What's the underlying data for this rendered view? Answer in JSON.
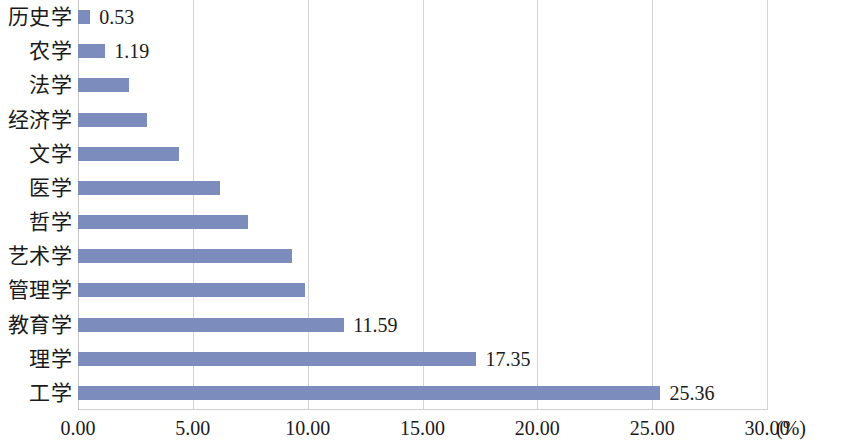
{
  "chart_data": {
    "type": "bar",
    "orientation": "horizontal",
    "title": "",
    "xlabel": "(%)",
    "ylabel": "",
    "xlim": [
      0,
      30
    ],
    "xticks": [
      "0.00",
      "5.00",
      "10.00",
      "15.00",
      "20.00",
      "25.00",
      "30.00"
    ],
    "xtick_values": [
      0,
      5,
      10,
      15,
      20,
      25,
      30
    ],
    "grid": true,
    "legend": false,
    "unit_suffix": "(%)",
    "bar_color": "#7c8cbd",
    "categories": [
      "历史学",
      "农学",
      "法学",
      "经济学",
      "文学",
      "医学",
      "哲学",
      "艺术学",
      "管理学",
      "教育学",
      "理学",
      "工学"
    ],
    "values": [
      0.53,
      1.19,
      2.2,
      3.0,
      4.4,
      6.2,
      7.4,
      9.3,
      9.9,
      11.59,
      17.35,
      25.36
    ],
    "data_labels": [
      "0.53",
      "1.19",
      "",
      "",
      "",
      "",
      "",
      "",
      "",
      "11.59",
      "17.35",
      "25.36"
    ],
    "bars": [
      {
        "category": "历史学",
        "value": 0.53,
        "label": "0.53",
        "label_visible": true
      },
      {
        "category": "农学",
        "value": 1.19,
        "label": "1.19",
        "label_visible": true
      },
      {
        "category": "法学",
        "value": 2.2,
        "label": "",
        "label_visible": false
      },
      {
        "category": "经济学",
        "value": 3.0,
        "label": "",
        "label_visible": false
      },
      {
        "category": "文学",
        "value": 4.4,
        "label": "",
        "label_visible": false
      },
      {
        "category": "医学",
        "value": 6.2,
        "label": "",
        "label_visible": false
      },
      {
        "category": "哲学",
        "value": 7.4,
        "label": "",
        "label_visible": false
      },
      {
        "category": "艺术学",
        "value": 9.3,
        "label": "",
        "label_visible": false
      },
      {
        "category": "管理学",
        "value": 9.9,
        "label": "",
        "label_visible": false
      },
      {
        "category": "教育学",
        "value": 11.59,
        "label": "11.59",
        "label_visible": true
      },
      {
        "category": "理学",
        "value": 17.35,
        "label": "17.35",
        "label_visible": true
      },
      {
        "category": "工学",
        "value": 25.36,
        "label": "25.36",
        "label_visible": true
      }
    ]
  }
}
